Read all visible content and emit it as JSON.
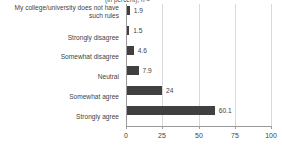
{
  "chart_data": {
    "type": "bar",
    "orientation": "horizontal",
    "title": "(in percent), n =",
    "xlabel": "",
    "ylabel": "",
    "xlim": [
      0,
      100
    ],
    "xticks": [
      0,
      25,
      50,
      75,
      100
    ],
    "xtick_labels": [
      "0",
      "25",
      "50",
      "75",
      "100"
    ],
    "grid": true,
    "legend": "none",
    "bar_color": "#404040",
    "gridline_color": "#d9d9d9",
    "axis_color": "#9a9a9a",
    "categories": [
      "My college/university does not have such rules",
      "Strongly disagree",
      "Somewhat disagree",
      "Neutral",
      "Somewhat agree",
      "Strongly agree"
    ],
    "values": [
      1.9,
      1.5,
      4.6,
      7.9,
      24,
      60.1
    ],
    "value_labels": [
      "1.9",
      "1.5",
      "4.6",
      "7.9",
      "24",
      "60.1"
    ]
  }
}
